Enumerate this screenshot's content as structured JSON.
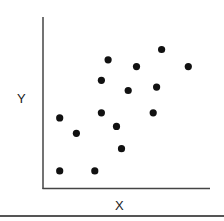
{
  "chart_data": {
    "type": "scatter",
    "title": "",
    "xlabel": "X",
    "ylabel": "Y",
    "xlim": [
      0,
      10
    ],
    "ylim": [
      0,
      10
    ],
    "grid": false,
    "legend": null,
    "ticks": "none",
    "point_color": "#111111",
    "points": [
      {
        "x": 1.0,
        "y": 1.0
      },
      {
        "x": 3.1,
        "y": 1.0
      },
      {
        "x": 1.0,
        "y": 4.1
      },
      {
        "x": 2.0,
        "y": 3.2
      },
      {
        "x": 3.5,
        "y": 4.4
      },
      {
        "x": 3.5,
        "y": 6.3
      },
      {
        "x": 3.9,
        "y": 7.5
      },
      {
        "x": 4.4,
        "y": 3.6
      },
      {
        "x": 4.7,
        "y": 2.3
      },
      {
        "x": 5.1,
        "y": 5.7
      },
      {
        "x": 5.6,
        "y": 7.1
      },
      {
        "x": 6.6,
        "y": 4.4
      },
      {
        "x": 6.8,
        "y": 5.9
      },
      {
        "x": 7.1,
        "y": 8.1
      },
      {
        "x": 8.7,
        "y": 7.1
      }
    ]
  },
  "axes": {
    "x_label": "X",
    "y_label": "Y",
    "axis_color": "#444444"
  }
}
